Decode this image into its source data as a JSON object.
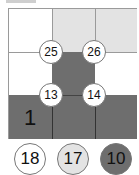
{
  "grid": {
    "rows": 3,
    "cols": 3,
    "cells": [
      [
        "white",
        "light",
        "light"
      ],
      [
        "white",
        "dark",
        "white"
      ],
      [
        "dark",
        "dark",
        "dark"
      ]
    ],
    "region_label": "1"
  },
  "vertices": [
    {
      "label": "25"
    },
    {
      "label": "26"
    },
    {
      "label": "13"
    },
    {
      "label": "14"
    }
  ],
  "legend": [
    {
      "label": "18",
      "color": "#ffffff"
    },
    {
      "label": "17",
      "color": "#e3e3e3"
    },
    {
      "label": "10",
      "color": "#6e6e6e"
    }
  ]
}
